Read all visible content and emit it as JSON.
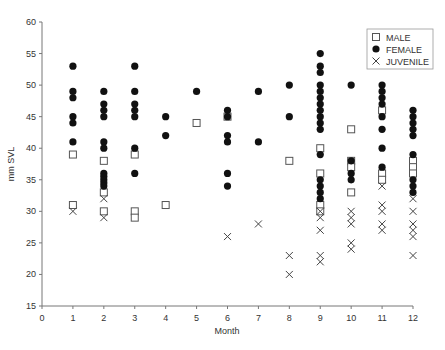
{
  "chart_data": {
    "type": "scatter",
    "title": "",
    "xlabel": "Month",
    "ylabel": "mm SVL",
    "xlim": [
      0,
      12
    ],
    "ylim": [
      15,
      60
    ],
    "x_ticks": [
      0,
      1,
      2,
      3,
      4,
      5,
      6,
      7,
      8,
      9,
      10,
      11,
      12
    ],
    "y_ticks": [
      15,
      20,
      25,
      30,
      35,
      40,
      45,
      50,
      55,
      60
    ],
    "grid": false,
    "legend_position": "top-right",
    "series": [
      {
        "name": "MALE",
        "marker": "open-square",
        "points": [
          [
            1,
            39
          ],
          [
            1,
            31
          ],
          [
            2,
            38
          ],
          [
            2,
            33
          ],
          [
            2,
            30
          ],
          [
            3,
            39
          ],
          [
            3,
            30
          ],
          [
            3,
            29
          ],
          [
            4,
            31
          ],
          [
            5,
            44
          ],
          [
            6,
            45
          ],
          [
            8,
            38
          ],
          [
            9,
            40
          ],
          [
            9,
            36
          ],
          [
            9,
            31
          ],
          [
            9,
            30
          ],
          [
            10,
            43
          ],
          [
            10,
            38
          ],
          [
            10,
            37
          ],
          [
            10,
            33
          ],
          [
            11,
            46
          ],
          [
            11,
            36
          ],
          [
            11,
            35
          ],
          [
            12,
            38
          ],
          [
            12,
            37
          ],
          [
            12,
            36
          ]
        ]
      },
      {
        "name": "FEMALE",
        "marker": "filled-circle",
        "points": [
          [
            1,
            53
          ],
          [
            1,
            49
          ],
          [
            1,
            48
          ],
          [
            1,
            45
          ],
          [
            1,
            44
          ],
          [
            1,
            41
          ],
          [
            2,
            49
          ],
          [
            2,
            47
          ],
          [
            2,
            46
          ],
          [
            2,
            45
          ],
          [
            2,
            41
          ],
          [
            2,
            40
          ],
          [
            2,
            36
          ],
          [
            2,
            35.5
          ],
          [
            2,
            35
          ],
          [
            2,
            34.5
          ],
          [
            2,
            34
          ],
          [
            3,
            53
          ],
          [
            3,
            49
          ],
          [
            3,
            47
          ],
          [
            3,
            46
          ],
          [
            3,
            45
          ],
          [
            3,
            40
          ],
          [
            3,
            36
          ],
          [
            4,
            45
          ],
          [
            4,
            42
          ],
          [
            5,
            49
          ],
          [
            6,
            46
          ],
          [
            6,
            45
          ],
          [
            6,
            42
          ],
          [
            6,
            41
          ],
          [
            6,
            36
          ],
          [
            6,
            34
          ],
          [
            7,
            49
          ],
          [
            7,
            41
          ],
          [
            8,
            50
          ],
          [
            8,
            45
          ],
          [
            9,
            55
          ],
          [
            9,
            53
          ],
          [
            9,
            52
          ],
          [
            9,
            50
          ],
          [
            9,
            49
          ],
          [
            9,
            48
          ],
          [
            9,
            47
          ],
          [
            9,
            46
          ],
          [
            9,
            45
          ],
          [
            9,
            44
          ],
          [
            9,
            43
          ],
          [
            9,
            39
          ],
          [
            9,
            35
          ],
          [
            9,
            34
          ],
          [
            9,
            33
          ],
          [
            9,
            32
          ],
          [
            10,
            50
          ],
          [
            10,
            38
          ],
          [
            10,
            36
          ],
          [
            10,
            35
          ],
          [
            11,
            50
          ],
          [
            11,
            49
          ],
          [
            11,
            48
          ],
          [
            11,
            47
          ],
          [
            11,
            45
          ],
          [
            11,
            43
          ],
          [
            11,
            40
          ],
          [
            11,
            37
          ],
          [
            12,
            46
          ],
          [
            12,
            45
          ],
          [
            12,
            44
          ],
          [
            12,
            43
          ],
          [
            12,
            42
          ],
          [
            12,
            39
          ],
          [
            12,
            35
          ],
          [
            12,
            34
          ],
          [
            12,
            33
          ]
        ]
      },
      {
        "name": "JUVENILE",
        "marker": "x",
        "points": [
          [
            1,
            30
          ],
          [
            2,
            32
          ],
          [
            2,
            29
          ],
          [
            6,
            26
          ],
          [
            7,
            28
          ],
          [
            8,
            23
          ],
          [
            8,
            20
          ],
          [
            9,
            30
          ],
          [
            9,
            29
          ],
          [
            9,
            27
          ],
          [
            9,
            23
          ],
          [
            9,
            22
          ],
          [
            10,
            30
          ],
          [
            10,
            29
          ],
          [
            10,
            28
          ],
          [
            10,
            25
          ],
          [
            10,
            24
          ],
          [
            11,
            34
          ],
          [
            11,
            31
          ],
          [
            11,
            30
          ],
          [
            11,
            28
          ],
          [
            11,
            27
          ],
          [
            12,
            32
          ],
          [
            12,
            30
          ],
          [
            12,
            28
          ],
          [
            12,
            27
          ],
          [
            12,
            26
          ],
          [
            12,
            23
          ]
        ]
      }
    ]
  }
}
